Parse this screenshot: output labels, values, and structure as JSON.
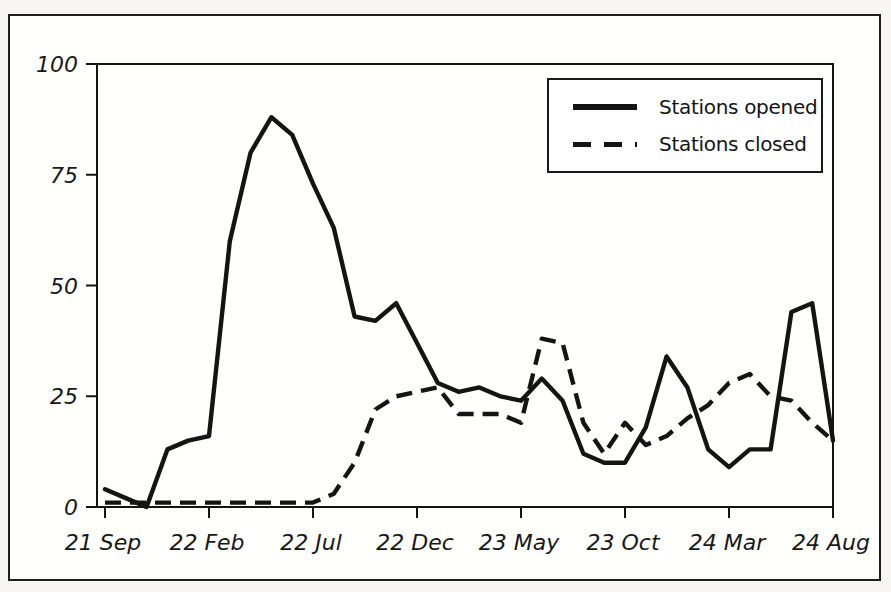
{
  "figure": {
    "background": "#fffffe",
    "frame_color": "#1f1f1f",
    "line_color": "#141414"
  },
  "legend": {
    "position": "top-right",
    "entries": [
      {
        "label": "Stations opened",
        "style": "solid"
      },
      {
        "label": "Stations closed",
        "style": "dashed"
      }
    ]
  },
  "chart_data": {
    "type": "line",
    "title": "",
    "xlabel": "",
    "ylabel": "",
    "grid": false,
    "ylim": [
      0,
      100
    ],
    "y_ticks": [
      0,
      25,
      50,
      75,
      100
    ],
    "x_unit": "month",
    "x_range_months": 36,
    "x_tick_labels": [
      {
        "index": 0,
        "label": "21 Sep"
      },
      {
        "index": 5,
        "label": "22 Feb"
      },
      {
        "index": 10,
        "label": "22 Jul"
      },
      {
        "index": 15,
        "label": "22 Dec"
      },
      {
        "index": 20,
        "label": "23 May"
      },
      {
        "index": 25,
        "label": "23 Oct"
      },
      {
        "index": 30,
        "label": "24 Mar"
      },
      {
        "index": 35,
        "label": "24 Aug"
      }
    ],
    "series": [
      {
        "name": "Stations opened",
        "style": "solid",
        "values": [
          4,
          2,
          0,
          13,
          15,
          16,
          60,
          80,
          88,
          84,
          73,
          63,
          43,
          42,
          46,
          37,
          28,
          26,
          27,
          25,
          24,
          29,
          24,
          12,
          10,
          10,
          18,
          34,
          27,
          13,
          9,
          13,
          13,
          44,
          46,
          15
        ]
      },
      {
        "name": "Stations closed",
        "style": "dashed",
        "values": [
          1,
          1,
          1,
          1,
          1,
          1,
          1,
          1,
          1,
          1,
          1,
          3,
          10,
          22,
          25,
          26,
          27,
          21,
          21,
          21,
          19,
          38,
          37,
          19,
          12,
          19,
          14,
          16,
          20,
          23,
          28,
          30,
          25,
          24,
          19,
          15
        ]
      }
    ]
  }
}
